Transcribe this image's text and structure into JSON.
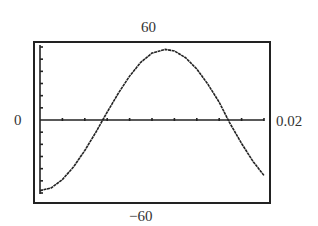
{
  "chart_data": {
    "type": "line",
    "title": "",
    "xlabel": "",
    "ylabel": "",
    "xlim": [
      0,
      0.02
    ],
    "ylim": [
      -60,
      60
    ],
    "x_tick_step": 0.002,
    "y_tick_step": 10,
    "grid": false,
    "legend": null,
    "window_labels": {
      "ymax": "60",
      "ymin": "−60",
      "xmin": "0",
      "xmax": "0.02"
    },
    "series": [
      {
        "name": "curve",
        "x": [
          0,
          0.001,
          0.002,
          0.003,
          0.004,
          0.005,
          0.0056,
          0.006,
          0.007,
          0.008,
          0.009,
          0.01,
          0.0112,
          0.012,
          0.013,
          0.014,
          0.015,
          0.016,
          0.0168,
          0.017,
          0.018,
          0.019,
          0.02
        ],
        "y": [
          -58,
          -55.8,
          -49.0,
          -38.5,
          -25.1,
          -9.9,
          0,
          6.5,
          22.0,
          36.1,
          47.4,
          55.0,
          58,
          56.7,
          51.2,
          41.9,
          29.3,
          14.6,
          0,
          -3.4,
          -19.3,
          -33.8,
          -45.6
        ]
      }
    ]
  },
  "labels": {
    "ymax": "60",
    "ymin": "−60",
    "xmin": "0",
    "xmax": "0.02"
  }
}
